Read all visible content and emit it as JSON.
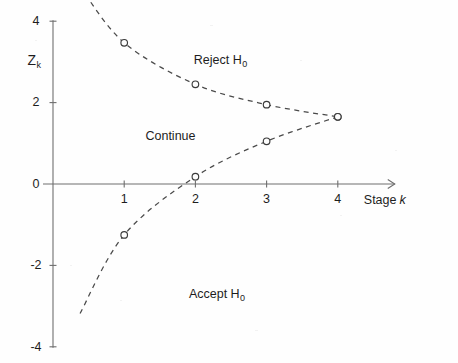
{
  "figure": {
    "background_color": "#fefefe",
    "curve_color": "#4a4a4a",
    "axis_color": "#6e6e6e",
    "marker_color": "#3b3b3b"
  },
  "axes": {
    "x_title_text": "Stage",
    "x_title_symbol": "k",
    "y_title_symbol": "Z",
    "y_title_subscript": "k",
    "x_ticks": [
      "1",
      "2",
      "3",
      "4"
    ],
    "x_tick_values": [
      1,
      2,
      3,
      4
    ],
    "y_ticks": [
      "4",
      "2",
      "0",
      "-2",
      "-4"
    ],
    "y_tick_values": [
      4,
      2,
      0,
      -2,
      -4
    ],
    "x_range": [
      0.4,
      4.8
    ],
    "y_range": [
      -4,
      4
    ],
    "grid": false,
    "x_arrow": true
  },
  "regions": [
    {
      "label_text": "Reject H",
      "label_subscript": "0",
      "name": "reject"
    },
    {
      "label_text": "Continue",
      "label_subscript": "",
      "name": "continue"
    },
    {
      "label_text": "Accept H",
      "label_subscript": "0",
      "name": "accept"
    }
  ],
  "chart_data": {
    "type": "line",
    "title": "",
    "xlabel": "Stage k",
    "ylabel": "Z_k",
    "xlim": [
      0.4,
      4.8
    ],
    "ylim": [
      -4,
      4
    ],
    "grid": false,
    "legend": "none",
    "x": [
      1,
      2,
      3,
      4
    ],
    "series": [
      {
        "name": "Upper boundary (reject H0)",
        "style": "dashed",
        "markers": "open-circle",
        "values": [
          3.47,
          2.45,
          1.95,
          1.65
        ]
      },
      {
        "name": "Lower boundary (accept H0)",
        "style": "dashed",
        "markers": "open-circle",
        "values": [
          -1.25,
          0.18,
          1.05,
          1.65
        ]
      }
    ],
    "annotations": [
      {
        "text": "Reject H0",
        "x": 2.35,
        "y": 3.05
      },
      {
        "text": "Continue",
        "x": 1.65,
        "y": 1.18
      },
      {
        "text": "Accept H0",
        "x": 2.3,
        "y": -2.72
      }
    ]
  }
}
